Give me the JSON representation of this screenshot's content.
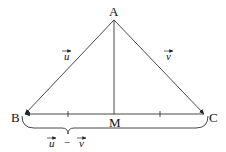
{
  "diagram": {
    "type": "triangle-vector-diagram",
    "points": {
      "A": "A",
      "B": "B",
      "C": "C",
      "M": "M"
    },
    "vectors": {
      "AB": "u",
      "AC": "v",
      "BC_brace": {
        "left": "u",
        "operator": "−",
        "right": "v"
      }
    },
    "segments": [
      {
        "from": "A",
        "to": "B",
        "arrow": "B"
      },
      {
        "from": "A",
        "to": "C",
        "arrow": "C"
      },
      {
        "from": "C",
        "to": "B",
        "arrow": "B"
      },
      {
        "from": "A",
        "to": "M",
        "arrow": null
      }
    ],
    "equal_marks": [
      "BM",
      "MC"
    ]
  }
}
